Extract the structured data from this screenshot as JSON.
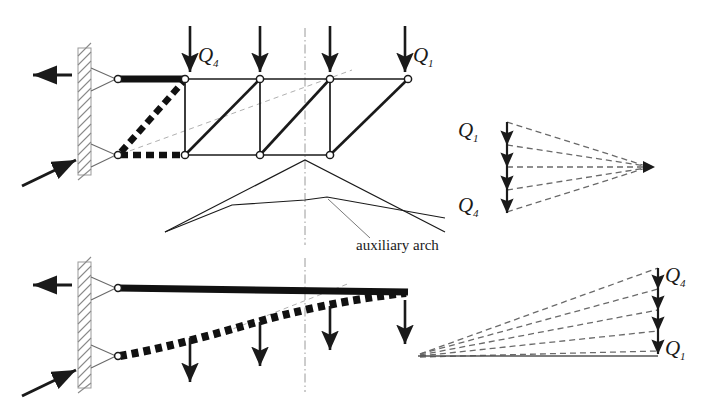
{
  "figure": {
    "name": "graphic-statics-cantilever-truss-force-polygon",
    "background": "#ffffff",
    "ink": "#1a1a1a",
    "gray": "#8a8a8a"
  },
  "labels": {
    "q1": "Q",
    "q1_sub": "1",
    "q4": "Q",
    "q4_sub": "4",
    "auxiliary_arch": "auxiliary arch"
  },
  "upper_truss": {
    "name": "upper-cantilever-truss",
    "top_chord_y": 79,
    "bottom_chord_y": 155,
    "top_nodes_x": [
      118,
      185,
      260,
      330,
      408
    ],
    "bottom_nodes_x": [
      118,
      185,
      260,
      330
    ],
    "bold_top_segment": [
      118,
      185
    ],
    "bold_bottom_segment": [
      118,
      185
    ],
    "bold_diagonal": [
      118,
      155,
      185,
      79
    ],
    "load_arrows_x": [
      190,
      260,
      330,
      405
    ],
    "load_arrow_top_y": 26,
    "load_arrow_bottom_y": 74,
    "centerline_x": 305,
    "wall_x": 78,
    "wall_top": 48,
    "wall_bottom": 175,
    "reaction_arrow_top": "left",
    "reaction_arrow_bottom": "up-right"
  },
  "auxiliary_arch": {
    "name": "auxiliary-arch-polylines",
    "outer": [
      [
        165,
        232
      ],
      [
        305,
        160
      ],
      [
        445,
        232
      ]
    ],
    "inner": [
      [
        165,
        232
      ],
      [
        232,
        205
      ],
      [
        305,
        200
      ],
      [
        325,
        197
      ],
      [
        445,
        218
      ]
    ],
    "leader": [
      [
        330,
        200
      ],
      [
        372,
        235
      ]
    ],
    "label_x": 358,
    "label_y": 248
  },
  "upper_polygon": {
    "name": "upper-force-polygon",
    "load_line_x": 507,
    "load_line_top": 122,
    "load_line_bottom": 212,
    "pole": [
      648,
      167
    ],
    "segments": 4,
    "rays": 5,
    "q1_label": [
      470,
      135
    ],
    "q4_label": [
      470,
      207
    ]
  },
  "lower_truss": {
    "name": "lower-cantilever-truss",
    "top_chord": [
      [
        118,
        288
      ],
      [
        408,
        292
      ]
    ],
    "curved_chord": [
      [
        118,
        356
      ],
      [
        180,
        342
      ],
      [
        245,
        325
      ],
      [
        305,
        310
      ],
      [
        360,
        299
      ],
      [
        408,
        293
      ]
    ],
    "load_arrows_x": [
      190,
      260,
      330,
      405
    ],
    "load_arrow_top_y": 300,
    "centerline_x": 305,
    "wall_x": 78,
    "wall_top": 262,
    "wall_bottom": 388,
    "reaction_arrow_top": "left",
    "reaction_arrow_bottom": "up-right"
  },
  "lower_polygon": {
    "name": "lower-force-polygon",
    "load_line_x": 658,
    "load_line_top": 268,
    "load_line_bottom": 352,
    "pole": [
      418,
      355
    ],
    "segments": 4,
    "rays": 5,
    "q4_label": [
      668,
      280
    ],
    "q1_label": [
      668,
      350
    ]
  }
}
